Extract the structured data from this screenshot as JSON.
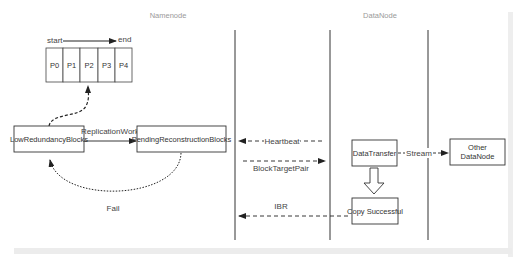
{
  "headers": {
    "namenode": "Namenode",
    "datanode": "DataNode"
  },
  "queue": {
    "start_label": "start",
    "end_label": "end",
    "slots": [
      "P0",
      "P1",
      "P2",
      "P3",
      "P4"
    ]
  },
  "boxes": {
    "low_redundancy": "LowRedundancyBlocks",
    "pending_reconstruction": "PendingReconstructionBlocks",
    "data_transfer": "DataTransfer",
    "copy_successful": "Copy Successful",
    "other_datanode_line1": "Other",
    "other_datanode_line2": "DataNode"
  },
  "edges": {
    "replication_work": "ReplicationWork",
    "fail": "Fail",
    "heartbeat": "Heartbeat",
    "block_target_pair": "BlockTargetPair",
    "ibr": "IBR",
    "stream": "Stream"
  }
}
